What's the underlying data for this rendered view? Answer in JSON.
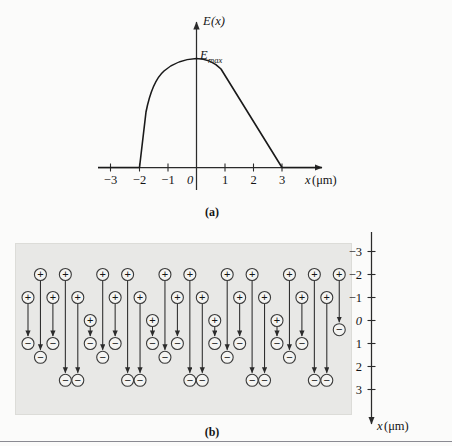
{
  "figure": {
    "panel_a": {
      "label": "(a)",
      "y_axis_label_main": "E",
      "y_axis_label_arg": "(x)",
      "peak_label_main": "E",
      "peak_label_sub": "max",
      "x_axis_label_var": "x",
      "x_axis_label_unit": "(μm)",
      "x_ticks": [
        {
          "value": -3,
          "label": "−3"
        },
        {
          "value": -2,
          "label": "−2"
        },
        {
          "value": -1,
          "label": "−1"
        },
        {
          "value": 0,
          "label": "0"
        },
        {
          "value": 1,
          "label": "1"
        },
        {
          "value": 2,
          "label": "2"
        },
        {
          "value": 3,
          "label": "3"
        }
      ]
    },
    "panel_b": {
      "label": "(b)",
      "x_axis_label_var": "x",
      "x_axis_label_unit": "(μm)",
      "x_ticks": [
        {
          "value": -3,
          "label": "−3"
        },
        {
          "value": -2,
          "label": "−2"
        },
        {
          "value": -1,
          "label": "−1"
        },
        {
          "value": 0,
          "label": "0"
        },
        {
          "value": 1,
          "label": "1"
        },
        {
          "value": 2,
          "label": "2"
        },
        {
          "value": 3,
          "label": "3"
        }
      ],
      "plus_glyph": "+",
      "minus_glyph": "−",
      "slab_color": "#e8e8e6"
    },
    "colors": {
      "line": "#222222",
      "curve": "#1a1a1a",
      "slab": "#e8e8e6",
      "circle_fill": "#f4f4f2",
      "circle_stroke": "#3a3a3a",
      "background": "#fbfbfa",
      "rule": "#8a8a92"
    }
  },
  "chart_data": [
    {
      "type": "line",
      "title": "(a) Electric field magnitude E(x) versus position",
      "xlabel": "x (μm)",
      "ylabel": "E(x)",
      "xlim": [
        -3.6,
        3.9
      ],
      "ylim": [
        0,
        1.12
      ],
      "grid": false,
      "legend": null,
      "annotations": [
        {
          "text": "E_max",
          "x": 0.0,
          "y": 1.0
        }
      ],
      "xticks": [
        -3,
        -2,
        -1,
        0,
        1,
        2,
        3
      ],
      "x": [
        -3.6,
        -2.0,
        -1.75,
        -1.5,
        -1.25,
        -1.0,
        -0.75,
        -0.5,
        -0.25,
        0.0,
        0.3,
        0.7,
        1.2,
        1.8,
        2.4,
        3.0,
        3.6
      ],
      "y": [
        0.0,
        0.0,
        0.28,
        0.56,
        0.74,
        0.82,
        0.89,
        0.94,
        0.98,
        1.0,
        0.93,
        0.82,
        0.66,
        0.47,
        0.26,
        0.0,
        0.0
      ]
    },
    {
      "type": "scatter",
      "title": "(b) Polarized dielectric slab: aligned electric dipoles",
      "xlabel": "x (μm)",
      "ylabel": "",
      "note": "Vertical axis is x, increasing downward from −3 (top) to 3 (bottom). Each dipole is a + charge above a − charge joined by a downward arrow.",
      "axis_orientation": "vertical-down",
      "ylim": [
        -3.4,
        3.4
      ],
      "yticks": [
        -3,
        -2,
        -1,
        0,
        1,
        2,
        3
      ],
      "dipoles": [
        {
          "col": 0,
          "plus_x": -1.0,
          "minus_x": 1.0
        },
        {
          "col": 1,
          "plus_x": -2.0,
          "minus_x": 1.6
        },
        {
          "col": 2,
          "plus_x": -1.0,
          "minus_x": 1.0
        },
        {
          "col": 3,
          "plus_x": -2.0,
          "minus_x": 2.6
        },
        {
          "col": 4,
          "plus_x": -1.0,
          "minus_x": 2.6
        },
        {
          "col": 5,
          "plus_x": 0.0,
          "minus_x": 1.0
        },
        {
          "col": 6,
          "plus_x": -2.0,
          "minus_x": 1.6
        },
        {
          "col": 7,
          "plus_x": -1.0,
          "minus_x": 1.0
        },
        {
          "col": 8,
          "plus_x": -2.0,
          "minus_x": 2.6
        },
        {
          "col": 9,
          "plus_x": -1.0,
          "minus_x": 2.6
        },
        {
          "col": 10,
          "plus_x": 0.0,
          "minus_x": 1.0
        },
        {
          "col": 11,
          "plus_x": -2.0,
          "minus_x": 1.6
        },
        {
          "col": 12,
          "plus_x": -1.0,
          "minus_x": 1.0
        },
        {
          "col": 13,
          "plus_x": -2.0,
          "minus_x": 2.6
        },
        {
          "col": 14,
          "plus_x": -1.0,
          "minus_x": 2.6
        },
        {
          "col": 15,
          "plus_x": 0.0,
          "minus_x": 1.0
        },
        {
          "col": 16,
          "plus_x": -2.0,
          "minus_x": 1.6
        },
        {
          "col": 17,
          "plus_x": -1.0,
          "minus_x": 1.0
        },
        {
          "col": 18,
          "plus_x": -2.0,
          "minus_x": 2.6
        },
        {
          "col": 19,
          "plus_x": -1.0,
          "minus_x": 2.6
        },
        {
          "col": 20,
          "plus_x": 0.0,
          "minus_x": 1.0
        },
        {
          "col": 21,
          "plus_x": -2.0,
          "minus_x": 1.6
        },
        {
          "col": 22,
          "plus_x": -1.0,
          "minus_x": 1.0
        },
        {
          "col": 23,
          "plus_x": -2.0,
          "minus_x": 2.6
        },
        {
          "col": 24,
          "plus_x": -1.0,
          "minus_x": 2.6
        },
        {
          "col": 25,
          "plus_x": -2.0,
          "minus_x": 0.4
        }
      ]
    }
  ]
}
